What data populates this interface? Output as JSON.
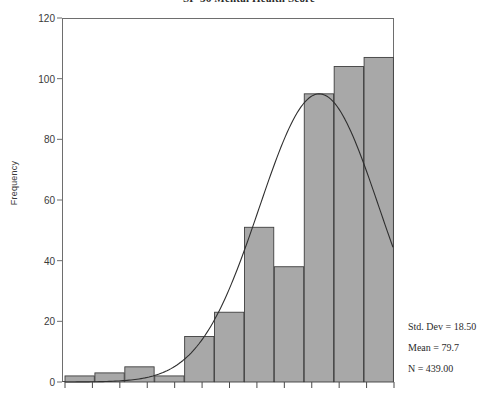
{
  "chart_data": {
    "type": "bar",
    "title": "SF-36 Mental Health Score",
    "xlabel": "",
    "ylabel": "Frequency",
    "ylim": [
      0,
      120
    ],
    "ytick_values": [
      0,
      20,
      40,
      60,
      80,
      100,
      120
    ],
    "ytick_labels": [
      "0",
      "20",
      "40",
      "60",
      "80",
      "100",
      "120"
    ],
    "grid": false,
    "legend": null,
    "bar_color": "#a8a8a8",
    "bar_edge_color": "#3f3f3f",
    "curve_color": "#2f2f2f",
    "xtick_count": 13,
    "xtick_labels_visible": false,
    "categories": [
      "1",
      "2",
      "3",
      "4",
      "5",
      "6",
      "7",
      "8",
      "9",
      "10",
      "11"
    ],
    "values": [
      2,
      3,
      5,
      2,
      15,
      23,
      51,
      38,
      95,
      104,
      107
    ],
    "overlay_curve": {
      "type": "normal",
      "mean": 79.7,
      "std_dev": 18.5,
      "peak_value": 95
    },
    "annotations": [
      "Std. Dev = 18.50",
      "Mean = 79.7",
      "N = 439.00"
    ],
    "stats": {
      "std_dev_label": "Std. Dev = 18.50",
      "mean_label": "Mean = 79.7",
      "n_label": "N = 439.00",
      "std_dev": 18.5,
      "mean": 79.7,
      "n": 439.0
    }
  }
}
